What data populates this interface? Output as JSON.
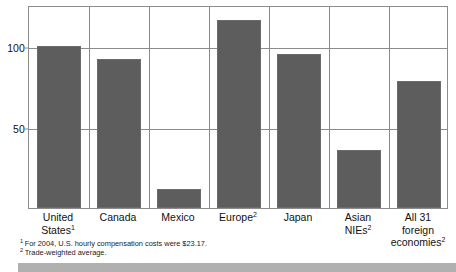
{
  "chart_data": {
    "type": "bar",
    "title": "",
    "xlabel": "",
    "ylabel": "",
    "categories": [
      "United States",
      "Canada",
      "Mexico",
      "Europe",
      "Japan",
      "Asian NIEs",
      "All 31 foreign economies"
    ],
    "category_labels": [
      {
        "line1": "United",
        "line2": "States",
        "sup": "1"
      },
      {
        "line1": "Canada",
        "line2": "",
        "sup": ""
      },
      {
        "line1": "Mexico",
        "line2": "",
        "sup": ""
      },
      {
        "line1": "Europe",
        "line2": "",
        "sup": "2"
      },
      {
        "line1": "Japan",
        "line2": "",
        "sup": ""
      },
      {
        "line1": "Asian",
        "line2": "NIEs",
        "sup": "2"
      },
      {
        "line1": "All 31 foreign",
        "line2": "economies",
        "sup": "2"
      }
    ],
    "values": [
      100,
      92,
      12,
      116,
      95,
      36,
      78
    ],
    "ylim": [
      0,
      125
    ],
    "yticks": [
      50,
      100
    ],
    "ytick_labels": [
      "50",
      "100"
    ],
    "grid": true,
    "legend": "none",
    "bar_color": "#5d5d5d",
    "grid_color": "#8c8c8c",
    "background": "#ffffff"
  },
  "footnotes": [
    {
      "marker": "1",
      "text": "For  2004, U.S. hourly compensation costs were $23.17."
    },
    {
      "marker": "2",
      "text": "Trade-weighted average."
    }
  ]
}
